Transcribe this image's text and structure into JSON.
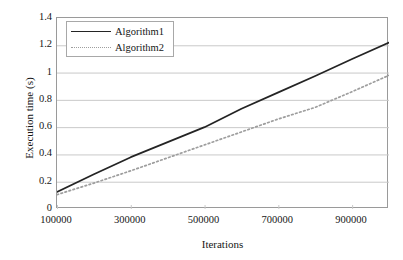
{
  "chart_data": {
    "type": "line",
    "title": "",
    "xlabel": "Iterations",
    "ylabel": "Execution time (s)",
    "xlim": [
      100000,
      1000000
    ],
    "ylim": [
      0,
      1.4
    ],
    "xticks": [
      "100000",
      "300000",
      "500000",
      "700000",
      "900000"
    ],
    "xtick_values": [
      100000,
      300000,
      500000,
      700000,
      900000
    ],
    "yticks": [
      "0",
      "0.2",
      "0.4",
      "0.6",
      "0.8",
      "1",
      "1.2",
      "1.4"
    ],
    "ytick_values": [
      0,
      0.2,
      0.4,
      0.6,
      0.8,
      1,
      1.2,
      1.4
    ],
    "grid": "horizontal",
    "legend_position": "upper-left-inside",
    "x": [
      100000,
      200000,
      300000,
      400000,
      500000,
      600000,
      700000,
      800000,
      900000,
      1000000
    ],
    "series": [
      {
        "name": "Algorithm1",
        "style": "solid",
        "color": "#242424",
        "values": [
          0.125,
          0.255,
          0.38,
          0.49,
          0.6,
          0.735,
          0.855,
          0.975,
          1.1,
          1.22
        ]
      },
      {
        "name": "Algorithm2",
        "style": "dotted",
        "color": "#9e9e9e",
        "values": [
          0.105,
          0.19,
          0.28,
          0.375,
          0.47,
          0.565,
          0.66,
          0.745,
          0.86,
          0.98
        ]
      }
    ]
  },
  "legend": {
    "items": [
      {
        "label": "Algorithm1",
        "key": "solid-line-key"
      },
      {
        "label": "Algorithm2",
        "key": "dotted-line-key"
      }
    ]
  },
  "colors": {
    "background": "#ffffff",
    "axis": "#9a9a9a",
    "grid": "#c9c9c9",
    "text": "#161616",
    "series1": "#242424",
    "series2": "#9e9e9e"
  }
}
